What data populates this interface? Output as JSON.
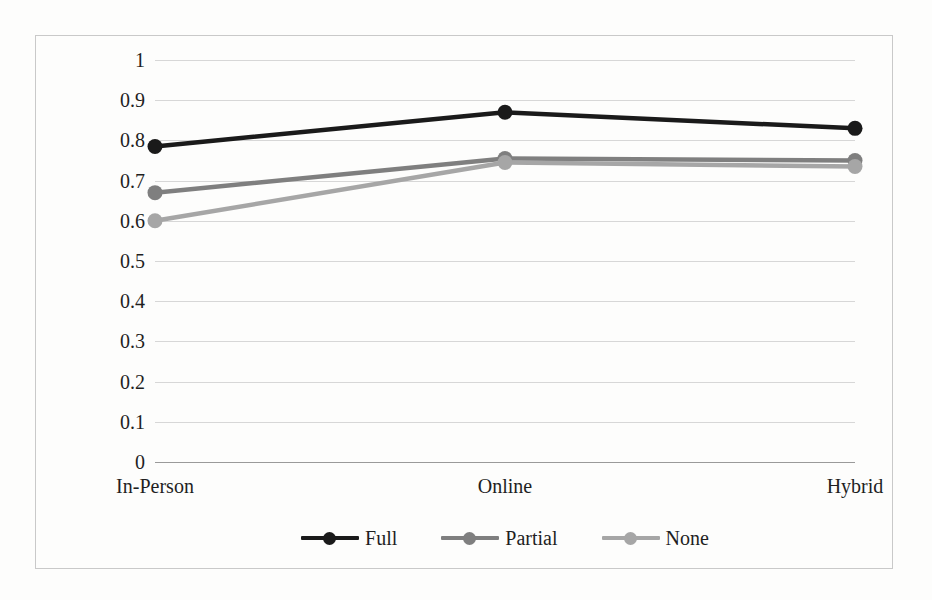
{
  "chart_data": {
    "type": "line",
    "title": "",
    "subtitle": "",
    "xlabel": "",
    "ylabel": "",
    "categories": [
      "In-Person",
      "Online",
      "Hybrid"
    ],
    "series": [
      {
        "name": "Full",
        "values": [
          0.785,
          0.87,
          0.83
        ],
        "color": "#1a1a1a"
      },
      {
        "name": "Partial",
        "values": [
          0.67,
          0.755,
          0.75
        ],
        "color": "#7f7f7f"
      },
      {
        "name": "None",
        "values": [
          0.6,
          0.745,
          0.735
        ],
        "color": "#a6a6a6"
      }
    ],
    "ylim": [
      0,
      1
    ],
    "y_ticks": [
      "0",
      "0.1",
      "0.2",
      "0.3",
      "0.4",
      "0.5",
      "0.6",
      "0.7",
      "0.8",
      "0.9",
      "1"
    ],
    "y_tick_values": [
      0,
      0.1,
      0.2,
      0.3,
      0.4,
      0.5,
      0.6,
      0.7,
      0.8,
      0.9,
      1
    ],
    "grid": true,
    "grid_color": "#d7d7d7",
    "axis_color": "#9a9a9a",
    "legend_position": "bottom",
    "markers": true,
    "marker_shape": "circle",
    "plot_background": "#fdfdfc",
    "frame_border_color": "#c9c9c9"
  },
  "legend": {
    "items": [
      {
        "label": "Full",
        "color": "#1a1a1a"
      },
      {
        "label": "Partial",
        "color": "#7f7f7f"
      },
      {
        "label": "None",
        "color": "#a6a6a6"
      }
    ]
  }
}
